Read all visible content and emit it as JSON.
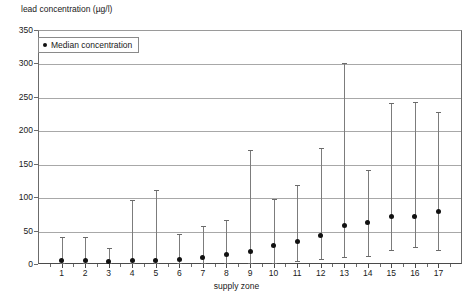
{
  "chart_data": {
    "type": "scatter",
    "title": "",
    "ylabel": "lead concentration (µg/l)",
    "xlabel": "supply zone",
    "ylim": [
      0,
      350
    ],
    "yticks": [
      0,
      50,
      100,
      150,
      200,
      250,
      300,
      350
    ],
    "grid": true,
    "legend": {
      "position": "top-left",
      "entries": [
        "Median concentration"
      ]
    },
    "categories": [
      "1",
      "2",
      "3",
      "4",
      "5",
      "6",
      "7",
      "8",
      "9",
      "10",
      "11",
      "12",
      "13",
      "14",
      "15",
      "16",
      "17"
    ],
    "series": [
      {
        "name": "Median concentration",
        "values": [
          5,
          5,
          4,
          5,
          5,
          6,
          9,
          14,
          19,
          28,
          34,
          42,
          57,
          62,
          71,
          71,
          78
        ]
      },
      {
        "name": "Upper whisker",
        "values": [
          40,
          41,
          24,
          96,
          111,
          45,
          57,
          66,
          170,
          97,
          118,
          173,
          300,
          141,
          241,
          243,
          227
        ]
      },
      {
        "name": "Lower whisker",
        "values": [
          1,
          1,
          1,
          1,
          1,
          1,
          1,
          1,
          1,
          2,
          5,
          8,
          11,
          12,
          21,
          25,
          21
        ]
      }
    ]
  }
}
